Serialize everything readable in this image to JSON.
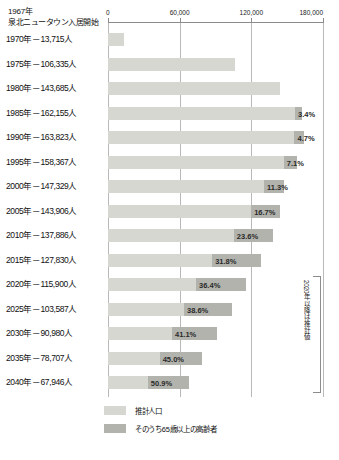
{
  "header": {
    "line1": "1967年",
    "line2": "泉北ニュータウン入居開始"
  },
  "chart_data": {
    "type": "bar",
    "orientation": "horizontal",
    "title": "",
    "xlabel": "",
    "ylabel": "",
    "xlim": [
      0,
      180000
    ],
    "xticks": [
      0,
      60000,
      120000,
      180000
    ],
    "xticklabels": [
      "0",
      "60,000",
      "120,000",
      "180,000"
    ],
    "grid": true,
    "legend_position": "bottom",
    "categories": [
      "1970年－13,715人",
      "1975年－106,335人",
      "1980年－143,685人",
      "1985年－162,155人",
      "1990年－163,823人",
      "1995年－158,367人",
      "2000年－147,329人",
      "2005年－143,906人",
      "2010年－137,886人",
      "2015年－127,830人",
      "2020年－115,900人",
      "2025年－103,587人",
      "2030年－90,980人",
      "2035年－78,707人",
      "2040年－67,946人"
    ],
    "series": [
      {
        "name": "推計人口",
        "values": [
          13715,
          106335,
          143685,
          162155,
          163823,
          158367,
          147329,
          143906,
          137886,
          127830,
          115900,
          103587,
          90980,
          78707,
          67946
        ]
      },
      {
        "name": "そのうち65歳以上の高齢者",
        "values": [
          null,
          null,
          null,
          5513,
          7700,
          11244,
          16648,
          24033,
          32541,
          40650,
          42188,
          39985,
          37393,
          35418,
          34585
        ],
        "labels": [
          "",
          "",
          "",
          "3.4%",
          "4.7%",
          "7.1%",
          "11.3%",
          "16.7%",
          "23.6%",
          "31.8%",
          "36.4%",
          "38.6%",
          "41.1%",
          "45.0%",
          "50.9%"
        ]
      }
    ],
    "annotations": [
      {
        "text": "2020年以降は推計値",
        "orientation": "vertical",
        "from_category": "2020年－115,900人",
        "to_category": "2040年－67,946人"
      }
    ],
    "legend": [
      "推計人口",
      "そのうち65歳以上の高齢者"
    ]
  }
}
